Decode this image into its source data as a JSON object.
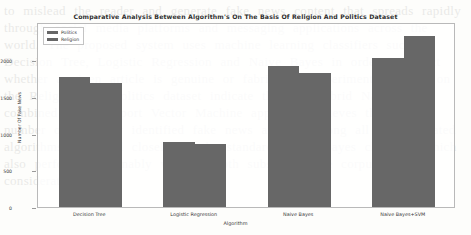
{
  "watermark_text": "to mislead the reader and generate fake news content that spreads rapidly through social media platforms and messaging applications across the world. The proposed system uses machine learning classifiers such as Decision Tree, Logistic Regression and Naive Bayes in order to detect whether a given article is genuine or fabricated. Experimental results on the Religion and Politics dataset indicate that the hybrid Naive Bayes combined with Support Vector Machine approach achieves the highest number of correctly identified fake news articles among all the evaluated algorithms, followed closely by the standard Naive Bayes classifier which also performs reasonably well on both subsets of the corpus under consideration here.",
  "chart_data": {
    "type": "bar",
    "title": "Comparative Analysis Between Algorithm's On The Basis Of Religion And Politics Dataset",
    "xlabel": "Algorithm",
    "ylabel": "Number Of Fake News",
    "categories": [
      "Decision Tree",
      "Logistic Regression",
      "Naive Bayes",
      "Naive Bayes+SVM"
    ],
    "series": [
      {
        "name": "Politics",
        "color": "#676767",
        "values": [
          1770,
          890,
          1925,
          2030
        ]
      },
      {
        "name": "Religion",
        "color": "#676767",
        "values": [
          1695,
          865,
          1820,
          2330
        ]
      }
    ],
    "yticks": [
      0,
      500,
      1000,
      1500,
      2000
    ],
    "ylim": [
      0,
      2520
    ],
    "grid": false,
    "legend_position": "upper-left",
    "bar_color": "#676767",
    "frame_color": "#b9b9b9"
  }
}
